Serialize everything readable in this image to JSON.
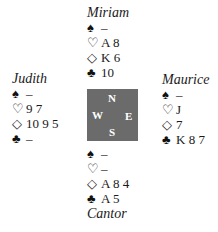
{
  "suits": {
    "spade": "♠",
    "heart": "♡",
    "diamond": "◇",
    "club": "♣"
  },
  "hands": {
    "north": {
      "name": "Miriam",
      "spades": "–",
      "hearts": "A 8",
      "diamonds": "K 6",
      "clubs": "10"
    },
    "west": {
      "name": "Judith",
      "spades": "–",
      "hearts": "9 7",
      "diamonds": "10 9 5",
      "clubs": "–"
    },
    "east": {
      "name": "Maurice",
      "spades": "–",
      "hearts": "J",
      "diamonds": "7",
      "clubs": "K 8 7"
    },
    "south": {
      "name": "Cantor",
      "spades": "–",
      "hearts": "–",
      "diamonds": "A 8 4",
      "clubs": "A 5"
    }
  },
  "compass": {
    "north": "N",
    "south": "S",
    "west": "W",
    "east": "E",
    "color": "#6b6b6b"
  }
}
